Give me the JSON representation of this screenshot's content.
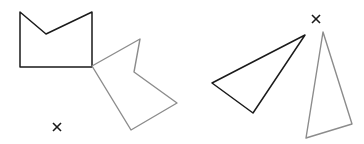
{
  "colors": {
    "original": "#1a1a1a",
    "image": "#8c8c8c",
    "center": "#1a1a1a",
    "background": "#ffffff"
  },
  "shapes": [
    {
      "name": "pentagon-original",
      "role": "original",
      "points": "20,12 46,34 92,12 92,67 20,67"
    },
    {
      "name": "pentagon-rotated",
      "role": "image",
      "points": "92,66 140,39 134,72 177,103 131,130"
    },
    {
      "name": "triangle-original",
      "role": "original",
      "points": "305,35 212,83 253,113"
    },
    {
      "name": "triangle-rotated",
      "role": "image",
      "points": "323,32 352,124 306,138"
    }
  ],
  "centers": [
    {
      "name": "rotation-center-left",
      "x": 57,
      "y": 127
    },
    {
      "name": "rotation-center-right",
      "x": 316,
      "y": 19
    }
  ]
}
